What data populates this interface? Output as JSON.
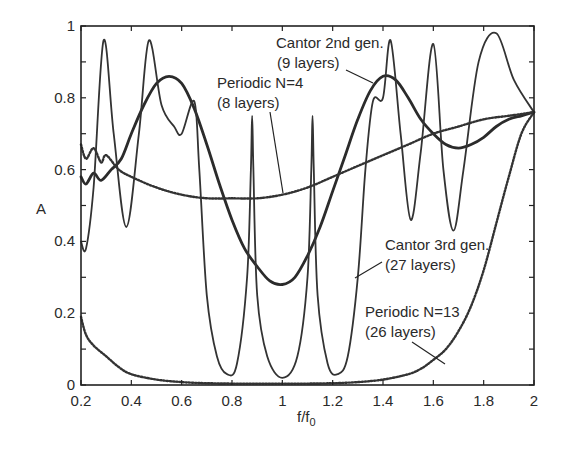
{
  "chart_data": {
    "type": "line",
    "title": "",
    "xlabel": "f/f0",
    "ylabel": "A",
    "xlim": [
      0.2,
      2
    ],
    "ylim": [
      0,
      1
    ],
    "grid": false,
    "x_ticks": [
      "0.2",
      "0.4",
      "0.6",
      "0.8",
      "1",
      "1.2",
      "1.4",
      "1.6",
      "1.8",
      "2"
    ],
    "y_ticks": [
      "0",
      "0.2",
      "0.4",
      "0.6",
      "0.8",
      "1"
    ],
    "series": [
      {
        "name": "Cantor 2nd gen. (9 layers)",
        "style": "thick-solid",
        "x": [
          0.2,
          0.22,
          0.25,
          0.28,
          0.32,
          0.36,
          0.4,
          0.45,
          0.5,
          0.55,
          0.6,
          0.65,
          0.7,
          0.75,
          0.8,
          0.85,
          0.9,
          0.95,
          1.0,
          1.05,
          1.1,
          1.15,
          1.2,
          1.25,
          1.3,
          1.35,
          1.4,
          1.45,
          1.5,
          1.55,
          1.6,
          1.65,
          1.7,
          1.75,
          1.8,
          1.85,
          1.9,
          1.95,
          2.0
        ],
        "y": [
          0.58,
          0.56,
          0.59,
          0.57,
          0.6,
          0.63,
          0.7,
          0.78,
          0.84,
          0.86,
          0.84,
          0.77,
          0.67,
          0.56,
          0.46,
          0.38,
          0.33,
          0.29,
          0.28,
          0.3,
          0.36,
          0.44,
          0.54,
          0.64,
          0.74,
          0.82,
          0.86,
          0.85,
          0.8,
          0.74,
          0.7,
          0.67,
          0.66,
          0.67,
          0.69,
          0.72,
          0.74,
          0.75,
          0.76
        ]
      },
      {
        "name": "Periodic N=4 (8 layers)",
        "style": "dotted",
        "x": [
          0.2,
          0.22,
          0.25,
          0.28,
          0.3,
          0.35,
          0.4,
          0.5,
          0.6,
          0.7,
          0.8,
          0.9,
          1.0,
          1.1,
          1.2,
          1.3,
          1.4,
          1.5,
          1.6,
          1.7,
          1.8,
          1.9,
          2.0
        ],
        "y": [
          0.67,
          0.63,
          0.66,
          0.62,
          0.64,
          0.6,
          0.58,
          0.55,
          0.53,
          0.52,
          0.52,
          0.52,
          0.53,
          0.55,
          0.58,
          0.61,
          0.64,
          0.67,
          0.7,
          0.72,
          0.74,
          0.75,
          0.76
        ]
      },
      {
        "name": "Cantor 3rd gen. (27 layers)",
        "style": "thin-solid",
        "x": [
          0.2,
          0.22,
          0.25,
          0.29,
          0.33,
          0.38,
          0.43,
          0.47,
          0.52,
          0.57,
          0.6,
          0.65,
          0.67,
          0.7,
          0.74,
          0.78,
          0.82,
          0.86,
          0.875,
          0.88,
          0.885,
          0.9,
          0.94,
          1.0,
          1.06,
          1.1,
          1.115,
          1.12,
          1.125,
          1.14,
          1.18,
          1.22,
          1.26,
          1.3,
          1.33,
          1.36,
          1.4,
          1.43,
          1.47,
          1.51,
          1.55,
          1.6,
          1.64,
          1.68,
          1.72,
          1.78,
          1.85,
          1.92,
          2.0
        ],
        "y": [
          0.4,
          0.38,
          0.55,
          0.96,
          0.7,
          0.44,
          0.7,
          0.96,
          0.78,
          0.72,
          0.7,
          0.79,
          0.6,
          0.25,
          0.08,
          0.03,
          0.06,
          0.3,
          0.6,
          0.75,
          0.6,
          0.25,
          0.08,
          0.02,
          0.08,
          0.3,
          0.6,
          0.75,
          0.6,
          0.25,
          0.06,
          0.03,
          0.08,
          0.3,
          0.6,
          0.79,
          0.8,
          0.96,
          0.7,
          0.46,
          0.65,
          0.95,
          0.6,
          0.43,
          0.6,
          0.9,
          0.98,
          0.85,
          0.76
        ]
      },
      {
        "name": "Periodic N=13 (26 layers)",
        "style": "dotted",
        "x": [
          0.2,
          0.22,
          0.25,
          0.3,
          0.35,
          0.4,
          0.5,
          0.6,
          0.7,
          0.8,
          0.9,
          1.0,
          1.1,
          1.2,
          1.3,
          1.4,
          1.5,
          1.55,
          1.6,
          1.65,
          1.7,
          1.75,
          1.8,
          1.85,
          1.9,
          1.95,
          2.0
        ],
        "y": [
          0.19,
          0.14,
          0.11,
          0.08,
          0.05,
          0.03,
          0.015,
          0.008,
          0.005,
          0.004,
          0.004,
          0.004,
          0.004,
          0.005,
          0.008,
          0.015,
          0.03,
          0.045,
          0.07,
          0.1,
          0.15,
          0.22,
          0.32,
          0.45,
          0.58,
          0.7,
          0.76
        ]
      }
    ],
    "annotations": [
      {
        "line1": "Cantor 2nd gen.",
        "line2": "(9 layers)"
      },
      {
        "line1": "Periodic N=4",
        "line2": "(8 layers)"
      },
      {
        "line1": "Cantor 3rd gen.",
        "line2": "(27 layers)"
      },
      {
        "line1": "Periodic N=13",
        "line2": "(26 layers)"
      }
    ]
  }
}
